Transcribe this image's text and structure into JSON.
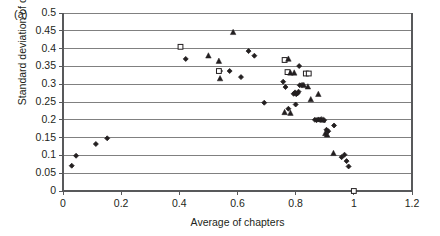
{
  "panel": {
    "label": "(a)"
  },
  "chart_data": {
    "type": "scatter",
    "title": "",
    "xlabel": "Average of chapters",
    "ylabel": "Standard deviation of chapters",
    "xlim": [
      0,
      1.2
    ],
    "ylim": [
      0,
      0.5
    ],
    "xticks": [
      "0",
      "0.2",
      "0.4",
      "0.6",
      "0.8",
      "1",
      "1.2"
    ],
    "xtick_values": [
      0,
      0.2,
      0.4,
      0.6,
      0.8,
      1,
      1.2
    ],
    "yticks": [
      "0",
      "0.05",
      "0.1",
      "0.15",
      "0.2",
      "0.25",
      "0.3",
      "0.35",
      "0.4",
      "0.45",
      "0.5"
    ],
    "ytick_values": [
      0,
      0.05,
      0.1,
      0.15,
      0.2,
      0.25,
      0.3,
      0.35,
      0.4,
      0.45,
      0.5
    ],
    "grid": "horizontal",
    "legend": "none",
    "colors": {
      "marker": "#231f20",
      "axis": "#808080",
      "grid": "#808080"
    },
    "series": [
      {
        "name": "filled-diamond",
        "marker": "diamond",
        "filled": true,
        "points": [
          [
            0.03,
            0.071
          ],
          [
            0.045,
            0.099
          ],
          [
            0.113,
            0.132
          ],
          [
            0.152,
            0.148
          ],
          [
            0.422,
            0.371
          ],
          [
            0.54,
            0.337
          ],
          [
            0.573,
            0.337
          ],
          [
            0.612,
            0.32
          ],
          [
            0.638,
            0.393
          ],
          [
            0.658,
            0.38
          ],
          [
            0.692,
            0.248
          ],
          [
            0.757,
            0.307
          ],
          [
            0.765,
            0.292
          ],
          [
            0.775,
            0.231
          ],
          [
            0.793,
            0.273
          ],
          [
            0.798,
            0.277
          ],
          [
            0.802,
            0.272
          ],
          [
            0.806,
            0.274
          ],
          [
            0.81,
            0.279
          ],
          [
            0.8,
            0.243
          ],
          [
            0.814,
            0.297
          ],
          [
            0.822,
            0.298
          ],
          [
            0.812,
            0.351
          ],
          [
            0.866,
            0.2
          ],
          [
            0.872,
            0.199
          ],
          [
            0.878,
            0.201
          ],
          [
            0.884,
            0.2
          ],
          [
            0.898,
            0.199
          ],
          [
            0.906,
            0.172
          ],
          [
            0.912,
            0.168
          ],
          [
            0.932,
            0.184
          ],
          [
            0.958,
            0.095
          ],
          [
            0.968,
            0.102
          ],
          [
            0.975,
            0.084
          ],
          [
            0.982,
            0.069
          ]
        ]
      },
      {
        "name": "open-square",
        "marker": "square",
        "filled": false,
        "points": [
          [
            0.404,
            0.405
          ],
          [
            0.536,
            0.337
          ],
          [
            0.762,
            0.368
          ],
          [
            0.772,
            0.334
          ],
          [
            0.835,
            0.33
          ],
          [
            0.845,
            0.33
          ],
          [
            1.0,
            0.0
          ]
        ]
      },
      {
        "name": "filled-triangle",
        "marker": "triangle",
        "filled": true,
        "points": [
          [
            0.5,
            0.38
          ],
          [
            0.536,
            0.365
          ],
          [
            0.54,
            0.316
          ],
          [
            0.585,
            0.446
          ],
          [
            0.775,
            0.371
          ],
          [
            0.782,
            0.332
          ],
          [
            0.795,
            0.332
          ],
          [
            0.828,
            0.297
          ],
          [
            0.842,
            0.293
          ],
          [
            0.852,
            0.257
          ],
          [
            0.878,
            0.272
          ],
          [
            0.888,
            0.201
          ],
          [
            0.894,
            0.2
          ],
          [
            0.902,
            0.162
          ],
          [
            0.908,
            0.158
          ],
          [
            0.762,
            0.221
          ],
          [
            0.782,
            0.219
          ],
          [
            0.93,
            0.106
          ]
        ]
      }
    ]
  }
}
